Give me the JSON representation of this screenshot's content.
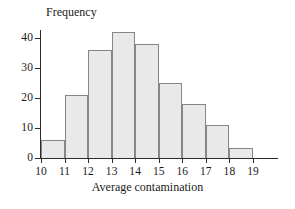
{
  "chart_data": {
    "type": "bar",
    "title": "",
    "subtitle": "",
    "xlabel": "Average contamination",
    "ylabel": "Frequency",
    "grid": false,
    "legend": null,
    "bin_edges": [
      10,
      11,
      12,
      13,
      14,
      15,
      16,
      17,
      18,
      19
    ],
    "categories": [
      "10-11",
      "11-12",
      "12-13",
      "13-14",
      "14-15",
      "15-16",
      "16-17",
      "17-18",
      "18-19"
    ],
    "values": [
      6,
      21,
      36,
      42,
      38,
      25,
      18,
      11,
      3.5
    ],
    "xlim": [
      10,
      19
    ],
    "ylim": [
      0,
      45
    ],
    "xticks": [
      10,
      11,
      12,
      13,
      14,
      15,
      16,
      17,
      18,
      19
    ],
    "xtick_labels": [
      "10",
      "11",
      "12",
      "13",
      "14",
      "15",
      "16",
      "17",
      "18",
      "19"
    ],
    "yticks": [
      0,
      10,
      20,
      30,
      40
    ],
    "ytick_labels": [
      "0",
      "10",
      "20",
      "30",
      "40"
    ],
    "bar_fill_color": "#e9e9e9",
    "bar_edge_color": "#868686",
    "axis_color": "#2b2b2b",
    "background_color": "#ffffff"
  }
}
